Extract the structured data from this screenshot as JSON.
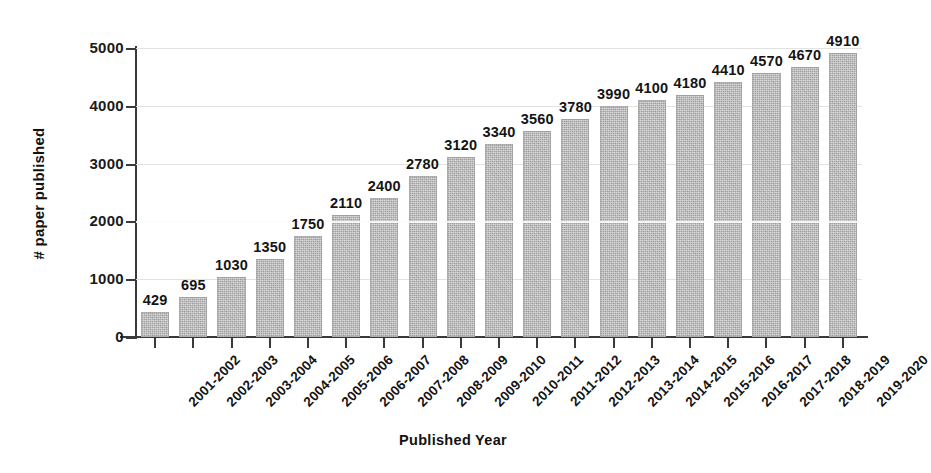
{
  "chart_data": {
    "type": "bar",
    "title": "",
    "xlabel": "Published Year",
    "ylabel": "# paper published",
    "categories": [
      "2001-2002",
      "2002-2003",
      "2003-2004",
      "2004-2005",
      "2005-2006",
      "2006-2007",
      "2007-2008",
      "2008-2009",
      "2009-2010",
      "2010-2011",
      "2011-2012",
      "2012-2013",
      "2013-2014",
      "2014-2015",
      "2015-2016",
      "2016-2017",
      "2017-2018",
      "2018-2019",
      "2019-2020"
    ],
    "values": [
      429,
      695,
      1030,
      1350,
      1750,
      2110,
      2400,
      2780,
      3120,
      3340,
      3560,
      3780,
      3990,
      4100,
      4180,
      4410,
      4570,
      4670,
      4910
    ],
    "value_labels": [
      "429",
      "695",
      "1030",
      "1350",
      "1750",
      "2110",
      "2400",
      "2780",
      "3120",
      "3340",
      "3560",
      "3780",
      "3990",
      "4100",
      "4180",
      "4410",
      "4570",
      "4670",
      "4910"
    ],
    "ylim": [
      0,
      5000
    ],
    "yticks": [
      0,
      1000,
      2000,
      3000,
      4000,
      5000
    ],
    "ytick_labels": [
      "0",
      "1000",
      "2000",
      "3000",
      "4000",
      "5000"
    ],
    "grid": true,
    "legend": false,
    "bar_color": "#b4b4b4",
    "text_color": "#141414",
    "axis_color": "#3a3a3a",
    "gridline_color": "#e2e2e2",
    "background_color": "#ffffff",
    "xtick_label_rotation": -45
  }
}
